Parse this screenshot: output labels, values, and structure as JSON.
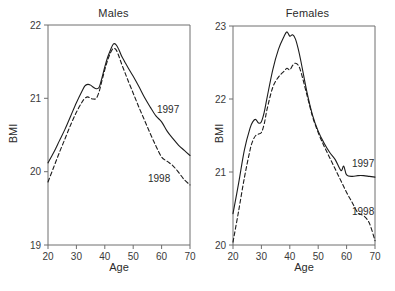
{
  "figure": {
    "background": "#ffffff",
    "line_color": "#1c1c1c",
    "axis_color": "#6e6e6e"
  },
  "panels": [
    {
      "key": "males",
      "title": "Males",
      "xlabel": "Age",
      "ylabel": "BMI",
      "series_label_1997": "1997",
      "series_label_1998": "1998",
      "xticks": [
        "20",
        "30",
        "40",
        "50",
        "60",
        "70"
      ],
      "yticks": [
        "19",
        "20",
        "21",
        "22"
      ]
    },
    {
      "key": "females",
      "title": "Females",
      "xlabel": "Age",
      "ylabel": "BMI",
      "series_label_1997": "1997",
      "series_label_1998": "1998",
      "xticks": [
        "20",
        "30",
        "40",
        "50",
        "60",
        "70"
      ],
      "yticks": [
        "20",
        "21",
        "22",
        "23"
      ]
    }
  ],
  "chart_data": [
    {
      "type": "line",
      "title": "Males",
      "xlabel": "Age",
      "ylabel": "BMI",
      "xlim": [
        20,
        70
      ],
      "ylim": [
        19,
        22
      ],
      "xticks": [
        20,
        30,
        40,
        50,
        60,
        70
      ],
      "yticks": [
        19,
        20,
        21,
        22
      ],
      "grid": false,
      "legend": "inline annotations at right end of each curve",
      "series": [
        {
          "name": "1997",
          "style": "solid",
          "x": [
            20,
            22,
            24,
            26,
            28,
            30,
            32,
            33,
            34,
            35,
            36,
            37,
            38,
            39,
            40,
            41,
            42,
            43,
            44,
            45,
            46,
            47,
            48,
            50,
            52,
            54,
            56,
            58,
            60,
            62,
            64,
            66,
            68,
            70
          ],
          "values": [
            20.12,
            20.26,
            20.42,
            20.58,
            20.76,
            20.94,
            21.1,
            21.17,
            21.19,
            21.18,
            21.15,
            21.13,
            21.15,
            21.28,
            21.43,
            21.56,
            21.66,
            21.74,
            21.73,
            21.66,
            21.57,
            21.5,
            21.43,
            21.3,
            21.16,
            21.01,
            20.88,
            20.76,
            20.68,
            20.55,
            20.45,
            20.36,
            20.29,
            20.22
          ]
        },
        {
          "name": "1998",
          "style": "dashed",
          "x": [
            20,
            22,
            24,
            26,
            28,
            30,
            32,
            33,
            34,
            35,
            36,
            37,
            38,
            39,
            40,
            41,
            42,
            43,
            44,
            45,
            46,
            47,
            48,
            50,
            52,
            54,
            56,
            58,
            60,
            62,
            64,
            66,
            68,
            70
          ],
          "values": [
            19.86,
            20.06,
            20.26,
            20.45,
            20.64,
            20.81,
            20.95,
            21.0,
            21.02,
            21.0,
            20.99,
            21.0,
            21.09,
            21.24,
            21.39,
            21.52,
            21.62,
            21.68,
            21.66,
            21.57,
            21.46,
            21.36,
            21.26,
            21.07,
            20.88,
            20.7,
            20.52,
            20.35,
            20.2,
            20.14,
            20.08,
            19.99,
            19.89,
            19.82
          ]
        }
      ]
    },
    {
      "type": "line",
      "title": "Females",
      "xlabel": "Age",
      "ylabel": "BMI",
      "xlim": [
        20,
        70
      ],
      "ylim": [
        20,
        23
      ],
      "xticks": [
        20,
        30,
        40,
        50,
        60,
        70
      ],
      "yticks": [
        20,
        21,
        22,
        23
      ],
      "grid": false,
      "legend": "inline annotations at right end of each curve",
      "series": [
        {
          "name": "1997",
          "style": "solid",
          "x": [
            20,
            22,
            24,
            26,
            27,
            28,
            29,
            30,
            31,
            32,
            34,
            36,
            38,
            39,
            40,
            41,
            42,
            43,
            44,
            46,
            48,
            50,
            52,
            54,
            56,
            58,
            59,
            60,
            62,
            64,
            66,
            68,
            70
          ],
          "values": [
            20.43,
            20.85,
            21.3,
            21.6,
            21.69,
            21.72,
            21.67,
            21.69,
            21.82,
            22.02,
            22.4,
            22.68,
            22.86,
            22.92,
            22.86,
            22.88,
            22.82,
            22.68,
            22.5,
            22.1,
            21.78,
            21.56,
            21.4,
            21.27,
            21.17,
            21.02,
            21.08,
            20.96,
            20.94,
            20.95,
            20.95,
            20.94,
            20.93
          ]
        },
        {
          "name": "1998",
          "style": "dashed",
          "x": [
            20,
            22,
            24,
            26,
            27,
            28,
            29,
            30,
            31,
            32,
            34,
            36,
            38,
            39,
            40,
            41,
            42,
            43,
            44,
            46,
            48,
            50,
            52,
            54,
            56,
            58,
            60,
            62,
            64,
            66,
            68,
            70
          ],
          "values": [
            20.04,
            20.47,
            20.92,
            21.3,
            21.43,
            21.5,
            21.52,
            21.54,
            21.66,
            21.86,
            22.16,
            22.3,
            22.38,
            22.42,
            22.4,
            22.46,
            22.49,
            22.46,
            22.36,
            22.06,
            21.76,
            21.54,
            21.36,
            21.2,
            21.04,
            20.88,
            20.72,
            20.58,
            20.44,
            20.4,
            20.3,
            20.06
          ]
        }
      ]
    }
  ]
}
